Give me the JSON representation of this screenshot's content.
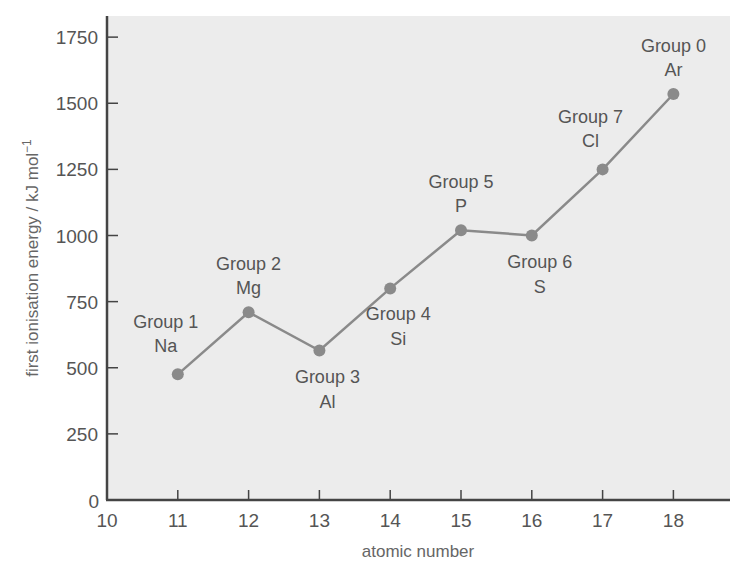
{
  "chart_data": {
    "type": "line",
    "title": "",
    "xlabel": "atomic number",
    "ylabel": "first ionisation energy / kJ mol",
    "ylabel_superscript": "−1",
    "xlim": [
      10,
      18.8
    ],
    "ylim": [
      0,
      1850
    ],
    "x_ticks": [
      10,
      11,
      12,
      13,
      14,
      15,
      16,
      17,
      18
    ],
    "y_ticks": [
      0,
      250,
      500,
      750,
      1000,
      1250,
      1500,
      1750
    ],
    "grid": false,
    "legend": null,
    "x": [
      11,
      12,
      13,
      14,
      15,
      16,
      17,
      18
    ],
    "values": [
      475,
      710,
      565,
      800,
      1020,
      1000,
      1250,
      1535
    ],
    "annotations": [
      {
        "x": 11,
        "group": "Group 1",
        "element": "Na",
        "position": "above-left"
      },
      {
        "x": 12,
        "group": "Group 2",
        "element": "Mg",
        "position": "above"
      },
      {
        "x": 13,
        "group": "Group 3",
        "element": "Al",
        "position": "below"
      },
      {
        "x": 14,
        "group": "Group 4",
        "element": "Si",
        "position": "below"
      },
      {
        "x": 15,
        "group": "Group 5",
        "element": "P",
        "position": "above"
      },
      {
        "x": 16,
        "group": "Group 6",
        "element": "S",
        "position": "below"
      },
      {
        "x": 17,
        "group": "Group 7",
        "element": "Cl",
        "position": "above-left"
      },
      {
        "x": 18,
        "group": "Group 0",
        "element": "Ar",
        "position": "above"
      }
    ],
    "colors": {
      "plot_background": "#ececec",
      "series": "#8a8a8a",
      "axis": "#444444",
      "text": "#555555"
    }
  }
}
